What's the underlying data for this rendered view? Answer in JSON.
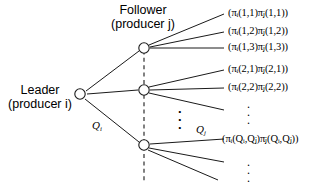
{
  "figure": {
    "type": "game-tree-diagram",
    "width": 316,
    "height": 184,
    "background": "#ffffff",
    "line_color": "#000000",
    "node_fill": "#ffffff"
  },
  "roles": {
    "leader": {
      "line1": "Leader",
      "line2": "(producer i)"
    },
    "follower": {
      "line1": "Follower",
      "line2": "(producer j)"
    }
  },
  "edge_labels": {
    "q_leader": "Qᵢ",
    "q_leader_base": "Q",
    "q_leader_sub": "i",
    "q_follower_base": "Q",
    "q_follower_sub": "j"
  },
  "payoffs": [
    {
      "id": "p11",
      "text": "(πᵢ(1,1)πⱼ(1,1))",
      "pi1_sub": "i",
      "args1": "(1,1)",
      "pi2_sub": "j",
      "args2": "(1,1)"
    },
    {
      "id": "p12",
      "text": "(πᵢ(1,2)πⱼ(1,2))",
      "pi1_sub": "i",
      "args1": "(1,2)",
      "pi2_sub": "j",
      "args2": "(1,2)"
    },
    {
      "id": "p13",
      "text": "(πᵢ(1,3)πⱼ(1,3))",
      "pi1_sub": "i",
      "args1": "(1,3)",
      "pi2_sub": "j",
      "args2": "(1,3)"
    },
    {
      "id": "p21",
      "text": "(πᵢ(2,1)πⱼ(2,1))",
      "pi1_sub": "i",
      "args1": "(2,1)",
      "pi2_sub": "j",
      "args2": "(2,1)"
    },
    {
      "id": "p22",
      "text": "(πᵢ(2,2)πⱼ(2,2))",
      "pi1_sub": "i",
      "args1": "(2,2)",
      "pi2_sub": "j",
      "args2": "(2,2)"
    },
    {
      "id": "pQQ",
      "text": "(πᵢ(Qᵢ,Qⱼ)πⱼ(Qᵢ,Qⱼ))",
      "pi1_sub": "i",
      "args1": "(Qi,Qj)",
      "pi2_sub": "j",
      "args2": "(Qi,Qj)"
    }
  ],
  "ellipses": {
    "right_upper": "⋮",
    "right_lower": "⋮",
    "center_vertical": "⋮"
  },
  "nodes": [
    {
      "id": "leader-node",
      "cx": 80,
      "cy": 94
    },
    {
      "id": "follower-node-1",
      "cx": 144,
      "cy": 48
    },
    {
      "id": "follower-node-2",
      "cx": 144,
      "cy": 90
    },
    {
      "id": "follower-node-3",
      "cx": 144,
      "cy": 145
    }
  ]
}
